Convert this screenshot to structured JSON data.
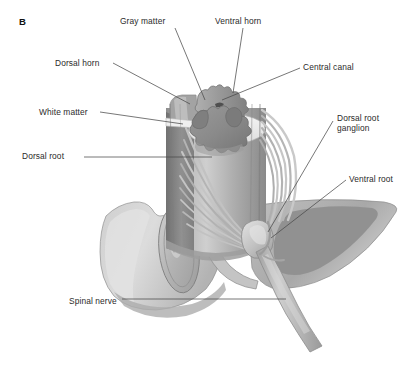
{
  "figure": {
    "panel_letter": "B",
    "panel_letter_name": "panel-letter-b",
    "background_color": "#ffffff",
    "text_color": "#2b2b2b",
    "leader_line_color": "#4a4a4a"
  },
  "palette": {
    "white_matter": "#a9a9a9",
    "white_matter_light": "#c9c9c9",
    "gray_matter": "#8e8e8e",
    "gray_matter_dark": "#7a7a7a",
    "cord_shadow": "#6f6f6f",
    "cut_face": "#efefef",
    "bone_light": "#d5d5d5",
    "bone_mid": "#bdbdbd",
    "bone_dark": "#9c9c9c",
    "bone_deep": "#8a8a8a",
    "nerve": "#c0c0c0",
    "nerve_edge": "#8f8f8f",
    "disc": "#b6b6b6",
    "outline": "#7c7c7c"
  },
  "labels": [
    {
      "id": "gray-matter",
      "text": "Gray matter",
      "x": 120,
      "y": 16,
      "align": "left"
    },
    {
      "id": "ventral-horn",
      "text": "Ventral horn",
      "x": 215,
      "y": 16,
      "align": "left"
    },
    {
      "id": "dorsal-horn",
      "text": "Dorsal horn",
      "x": 55,
      "y": 58,
      "align": "left"
    },
    {
      "id": "central-canal",
      "text": "Central canal",
      "x": 303,
      "y": 62,
      "align": "left"
    },
    {
      "id": "white-matter",
      "text": "White matter",
      "x": 39,
      "y": 107,
      "align": "left"
    },
    {
      "id": "dorsal-root-ganglion",
      "text": "Dorsal root\nganglion",
      "x": 337,
      "y": 113,
      "align": "left"
    },
    {
      "id": "dorsal-root",
      "text": "Dorsal root",
      "x": 22,
      "y": 151,
      "align": "left"
    },
    {
      "id": "ventral-root",
      "text": "Ventral root",
      "x": 349,
      "y": 174,
      "align": "left"
    },
    {
      "id": "spinal-nerve",
      "text": "Spinal nerve",
      "x": 69,
      "y": 296,
      "align": "left"
    }
  ],
  "leaders": [
    {
      "id": "leader-gray-matter",
      "d": "M 175 28 L 205 100"
    },
    {
      "id": "leader-ventral-horn",
      "d": "M 243 28 L 233 93"
    },
    {
      "id": "leader-dorsal-horn",
      "d": "M 113 63 L 190 104"
    },
    {
      "id": "leader-central-canal",
      "d": "M 300 68 L 222 100"
    },
    {
      "id": "leader-white-matter",
      "d": "M 100 112 L 183 124"
    },
    {
      "id": "leader-dorsal-root-ganglion",
      "d": "M 333 121 L 268 232"
    },
    {
      "id": "leader-dorsal-root",
      "d": "M 84 157 L 212 157"
    },
    {
      "id": "leader-ventral-root",
      "d": "M 346 180 L 271 238"
    },
    {
      "id": "leader-spinal-nerve",
      "d": "M 122 299 L 286 299"
    }
  ],
  "anatomy_parts": [
    {
      "id": "spinal-cord-column",
      "name": "spinal cord white matter column"
    },
    {
      "id": "gray-matter-butterfly",
      "name": "butterfly shaped gray matter on cut face"
    },
    {
      "id": "dorsal-horn-shape",
      "name": "posterior (dorsal) horn of gray matter"
    },
    {
      "id": "ventral-horn-shape",
      "name": "anterior (ventral) horn of gray matter"
    },
    {
      "id": "central-canal-dot",
      "name": "central canal opening"
    },
    {
      "id": "dorsal-rootlets",
      "name": "fanning dorsal rootlets"
    },
    {
      "id": "ventral-rootlets",
      "name": "fanning ventral rootlets"
    },
    {
      "id": "dorsal-root-ganglion-bulge",
      "name": "dorsal root ganglion swelling"
    },
    {
      "id": "spinal-nerve-trunk",
      "name": "spinal nerve trunk descending to lower right"
    },
    {
      "id": "vertebral-body",
      "name": "cut vertebral body"
    },
    {
      "id": "intervertebral-disc",
      "name": "intervertebral disc oval"
    },
    {
      "id": "vertebral-lamina-wing",
      "name": "dark vertebral lamina / transverse process wing"
    }
  ]
}
